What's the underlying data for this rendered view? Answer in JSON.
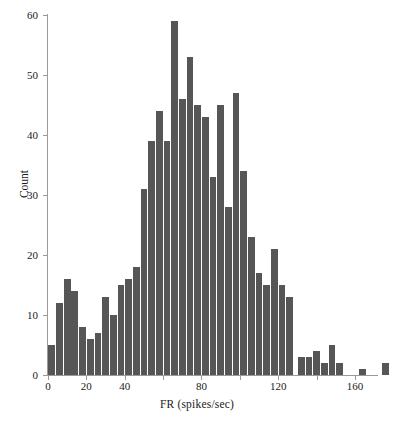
{
  "chart_data": {
    "type": "bar",
    "title": "",
    "xlabel": "FR (spikes/sec)",
    "ylabel": "Count",
    "xlim": [
      0,
      172
    ],
    "ylim": [
      0,
      60
    ],
    "xticks": [
      0,
      20,
      40,
      60,
      80,
      100,
      120,
      140,
      160
    ],
    "xtick_labels": [
      "0",
      "20",
      "40",
      "60",
      "80",
      "100",
      "120",
      "140",
      "160"
    ],
    "xtick_labels_shown": [
      "0",
      "20",
      "40",
      "80",
      "120",
      "160"
    ],
    "yticks": [
      0,
      10,
      20,
      30,
      40,
      50,
      60
    ],
    "ytick_labels": [
      "0",
      "10",
      "20",
      "30",
      "40",
      "50",
      "60"
    ],
    "grid": false,
    "legend": false,
    "bar_color": "#565656",
    "axis_color": "#9a9a9a",
    "bin_width": 4,
    "bin_centers": [
      2,
      6,
      10,
      14,
      18,
      22,
      26,
      30,
      34,
      38,
      42,
      46,
      50,
      54,
      58,
      62,
      66,
      70,
      74,
      78,
      82,
      86,
      90,
      94,
      98,
      102,
      106,
      110,
      114,
      118,
      122,
      126,
      130,
      134,
      138,
      142,
      146,
      154,
      166
    ],
    "values": [
      5,
      12,
      16,
      14,
      8,
      6,
      7,
      13,
      10,
      15,
      16,
      18,
      31,
      39,
      44,
      39,
      59,
      46,
      53,
      45,
      43,
      33,
      45,
      28,
      47,
      34,
      23,
      17,
      15,
      21,
      15,
      13,
      3,
      3,
      4,
      2,
      5,
      2,
      1,
      2
    ],
    "bars": [
      {
        "x": 2,
        "value": 5
      },
      {
        "x": 6,
        "value": 12
      },
      {
        "x": 10,
        "value": 16
      },
      {
        "x": 14,
        "value": 14
      },
      {
        "x": 18,
        "value": 8
      },
      {
        "x": 22,
        "value": 6
      },
      {
        "x": 26,
        "value": 7
      },
      {
        "x": 30,
        "value": 13
      },
      {
        "x": 34,
        "value": 10
      },
      {
        "x": 38,
        "value": 15
      },
      {
        "x": 42,
        "value": 16
      },
      {
        "x": 46,
        "value": 18
      },
      {
        "x": 50,
        "value": 31
      },
      {
        "x": 54,
        "value": 39
      },
      {
        "x": 58,
        "value": 44
      },
      {
        "x": 62,
        "value": 39
      },
      {
        "x": 66,
        "value": 59
      },
      {
        "x": 70,
        "value": 46
      },
      {
        "x": 74,
        "value": 53
      },
      {
        "x": 78,
        "value": 45
      },
      {
        "x": 82,
        "value": 43
      },
      {
        "x": 86,
        "value": 33
      },
      {
        "x": 90,
        "value": 45
      },
      {
        "x": 94,
        "value": 28
      },
      {
        "x": 98,
        "value": 47
      },
      {
        "x": 102,
        "value": 34
      },
      {
        "x": 106,
        "value": 23
      },
      {
        "x": 110,
        "value": 17
      },
      {
        "x": 114,
        "value": 15
      },
      {
        "x": 118,
        "value": 21
      },
      {
        "x": 122,
        "value": 15
      },
      {
        "x": 126,
        "value": 13
      },
      {
        "x": 132,
        "value": 3
      },
      {
        "x": 136,
        "value": 3
      },
      {
        "x": 140,
        "value": 4
      },
      {
        "x": 144,
        "value": 2
      },
      {
        "x": 148,
        "value": 5
      },
      {
        "x": 152,
        "value": 2
      },
      {
        "x": 164,
        "value": 1
      },
      {
        "x": 176,
        "value": 2
      }
    ]
  }
}
